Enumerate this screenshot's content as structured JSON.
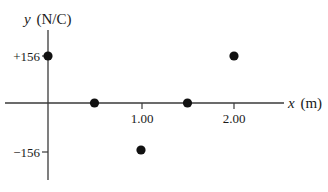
{
  "chart_data": {
    "type": "scatter",
    "title": "",
    "xlabel_var": "x",
    "xlabel_unit": "(m)",
    "ylabel_var": "y",
    "ylabel_unit": "(N/C)",
    "x_ticks": [
      {
        "value": 1.0,
        "label": "1.00"
      },
      {
        "value": 2.0,
        "label": "2.00"
      }
    ],
    "y_ticks": [
      {
        "value": 156,
        "label": "+156"
      },
      {
        "value": -156,
        "label": "−156"
      }
    ],
    "points": [
      {
        "x": 0.0,
        "y": 156
      },
      {
        "x": 0.5,
        "y": 0
      },
      {
        "x": 1.0,
        "y": -156
      },
      {
        "x": 1.5,
        "y": 0
      },
      {
        "x": 2.0,
        "y": 156
      }
    ],
    "xlim": [
      -0.3,
      2.6
    ],
    "ylim": [
      -200,
      200
    ],
    "grid": false,
    "legend": null
  },
  "colors": {
    "axis": "#3a3a3a",
    "point": "#111111",
    "text": "#1a1a1a"
  }
}
